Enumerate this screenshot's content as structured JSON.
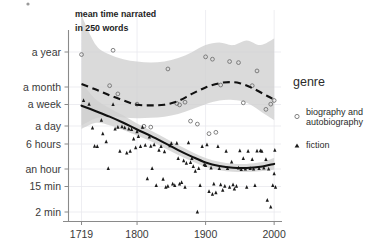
{
  "chart_data": {
    "type": "scatter",
    "title": "",
    "annotation": [
      "mean time narrated",
      "in 250 words"
    ],
    "xlabel": "",
    "ylabel": "",
    "xlim": [
      1700,
      2010
    ],
    "x_ticks": [
      1719,
      1800,
      1900,
      2000
    ],
    "x_tick_labels": [
      "1719",
      "1800",
      "1900",
      "2000"
    ],
    "y_tick_labels": [
      "a year",
      "a month",
      "a week",
      "a day",
      "6 hours",
      "an hour",
      "15 min",
      "2 min"
    ],
    "y_tick_values_minutes": [
      525600,
      43200,
      10080,
      1440,
      360,
      60,
      15,
      2
    ],
    "y_scale": "log",
    "grid": "vertical-faint",
    "legend": {
      "title": "genre",
      "position": "right",
      "entries": [
        {
          "label": "biography and autobiography",
          "marker": "open-circle",
          "color": "#6d6d6d"
        },
        {
          "label": "fiction",
          "marker": "filled-triangle",
          "color": "#1a1a1a"
        }
      ]
    },
    "series": [
      {
        "name": "biography and autobiography",
        "marker": "open-circle",
        "trend_style": "dashed",
        "trend_points": [
          [
            1719,
            43200
          ],
          [
            1740,
            28000
          ],
          [
            1760,
            18000
          ],
          [
            1780,
            12000
          ],
          [
            1800,
            8600
          ],
          [
            1820,
            8200
          ],
          [
            1840,
            8600
          ],
          [
            1860,
            11500
          ],
          [
            1880,
            20000
          ],
          [
            1900,
            33000
          ],
          [
            1920,
            46000
          ],
          [
            1935,
            50000
          ],
          [
            1950,
            46000
          ],
          [
            1970,
            30000
          ],
          [
            1990,
            17000
          ],
          [
            2000,
            13000
          ]
        ],
        "band_upper": [
          [
            1719,
            9000000
          ],
          [
            1740,
            900000
          ],
          [
            1760,
            430000
          ],
          [
            1780,
            300000
          ],
          [
            1800,
            250000
          ],
          [
            1820,
            230000
          ],
          [
            1840,
            250000
          ],
          [
            1860,
            330000
          ],
          [
            1880,
            520000
          ],
          [
            1900,
            900000
          ],
          [
            1920,
            1100000
          ],
          [
            1940,
            900000
          ],
          [
            1960,
            1300000
          ],
          [
            1980,
            900000
          ],
          [
            2000,
            1500000
          ]
        ],
        "band_lower": [
          [
            1719,
            1700
          ],
          [
            1740,
            3000
          ],
          [
            1760,
            3400
          ],
          [
            1780,
            3200
          ],
          [
            1800,
            3000
          ],
          [
            1820,
            3100
          ],
          [
            1840,
            3400
          ],
          [
            1860,
            4200
          ],
          [
            1880,
            6000
          ],
          [
            1900,
            9000
          ],
          [
            1920,
            12000
          ],
          [
            1940,
            12500
          ],
          [
            1960,
            10000
          ],
          [
            1980,
            5200
          ],
          [
            2000,
            2600
          ]
        ],
        "points": [
          [
            1719,
            430000
          ],
          [
            1765,
            600000
          ],
          [
            1760,
            38000
          ],
          [
            1772,
            20000
          ],
          [
            1800,
            9000
          ],
          [
            1810,
            1600
          ],
          [
            1820,
            1500
          ],
          [
            1845,
            140000
          ],
          [
            1858,
            9500
          ],
          [
            1862,
            8500
          ],
          [
            1870,
            10500
          ],
          [
            1878,
            2400
          ],
          [
            1888,
            1900
          ],
          [
            1900,
            360000
          ],
          [
            1905,
            900
          ],
          [
            1910,
            300000
          ],
          [
            1915,
            1000
          ],
          [
            1922,
            40000
          ],
          [
            1935,
            250000
          ],
          [
            1948,
            230000
          ],
          [
            1955,
            10000
          ],
          [
            1968,
            38000
          ],
          [
            1975,
            120000
          ],
          [
            1988,
            6000
          ],
          [
            1995,
            9000
          ],
          [
            2000,
            12000
          ]
        ]
      },
      {
        "name": "fiction",
        "marker": "filled-triangle",
        "trend_style": "solid",
        "trend_points": [
          [
            1719,
            8000
          ],
          [
            1740,
            5200
          ],
          [
            1760,
            3400
          ],
          [
            1780,
            2100
          ],
          [
            1800,
            1250
          ],
          [
            1820,
            760
          ],
          [
            1840,
            440
          ],
          [
            1860,
            250
          ],
          [
            1880,
            150
          ],
          [
            1900,
            95
          ],
          [
            1920,
            72
          ],
          [
            1940,
            63
          ],
          [
            1960,
            62
          ],
          [
            1980,
            68
          ],
          [
            2000,
            85
          ]
        ],
        "band_upper": [
          [
            1719,
            48000
          ],
          [
            1740,
            13000
          ],
          [
            1760,
            6600
          ],
          [
            1780,
            3700
          ],
          [
            1800,
            2000
          ],
          [
            1820,
            1150
          ],
          [
            1840,
            660
          ],
          [
            1860,
            370
          ],
          [
            1880,
            215
          ],
          [
            1900,
            135
          ],
          [
            1920,
            100
          ],
          [
            1940,
            86
          ],
          [
            1960,
            85
          ],
          [
            1980,
            96
          ],
          [
            2000,
            135
          ]
        ],
        "band_lower": [
          [
            1719,
            1300
          ],
          [
            1740,
            2100
          ],
          [
            1760,
            1750
          ],
          [
            1780,
            1200
          ],
          [
            1800,
            780
          ],
          [
            1820,
            500
          ],
          [
            1840,
            295
          ],
          [
            1860,
            170
          ],
          [
            1880,
            105
          ],
          [
            1900,
            67
          ],
          [
            1920,
            52
          ],
          [
            1940,
            46
          ],
          [
            1960,
            45
          ],
          [
            1980,
            48
          ],
          [
            2000,
            54
          ]
        ],
        "points": [
          [
            1722,
            12000
          ],
          [
            1730,
            9000
          ],
          [
            1735,
            1400
          ],
          [
            1738,
            340
          ],
          [
            1742,
            330
          ],
          [
            1748,
            2600
          ],
          [
            1750,
            900
          ],
          [
            1755,
            480
          ],
          [
            1758,
            60
          ],
          [
            1765,
            8800
          ],
          [
            1768,
            1300
          ],
          [
            1772,
            1500
          ],
          [
            1775,
            230
          ],
          [
            1778,
            1550
          ],
          [
            1782,
            1450
          ],
          [
            1785,
            200
          ],
          [
            1788,
            1300
          ],
          [
            1790,
            230
          ],
          [
            1792,
            1250
          ],
          [
            1795,
            600
          ],
          [
            1798,
            300
          ],
          [
            1800,
            1050
          ],
          [
            1802,
            720
          ],
          [
            1805,
            330
          ],
          [
            1808,
            1500
          ],
          [
            1812,
            370
          ],
          [
            1815,
            27
          ],
          [
            1818,
            700
          ],
          [
            1820,
            340
          ],
          [
            1822,
            60
          ],
          [
            1825,
            380
          ],
          [
            1828,
            16
          ],
          [
            1832,
            250
          ],
          [
            1835,
            330
          ],
          [
            1838,
            26
          ],
          [
            1840,
            220
          ],
          [
            1842,
            14
          ],
          [
            1845,
            15
          ],
          [
            1848,
            350
          ],
          [
            1850,
            420
          ],
          [
            1852,
            18
          ],
          [
            1855,
            16
          ],
          [
            1858,
            430
          ],
          [
            1860,
            130
          ],
          [
            1862,
            18
          ],
          [
            1865,
            20
          ],
          [
            1868,
            110
          ],
          [
            1870,
            14
          ],
          [
            1872,
            90
          ],
          [
            1875,
            450
          ],
          [
            1878,
            95
          ],
          [
            1880,
            130
          ],
          [
            1882,
            70
          ],
          [
            1885,
            48
          ],
          [
            1888,
            2
          ],
          [
            1890,
            60
          ],
          [
            1892,
            16
          ],
          [
            1895,
            330
          ],
          [
            1898,
            80
          ],
          [
            1900,
            75
          ],
          [
            1902,
            380
          ],
          [
            1905,
            10
          ],
          [
            1908,
            62
          ],
          [
            1910,
            8
          ],
          [
            1912,
            18
          ],
          [
            1915,
            9
          ],
          [
            1918,
            330
          ],
          [
            1920,
            60
          ],
          [
            1922,
            17
          ],
          [
            1925,
            11
          ],
          [
            1928,
            15
          ],
          [
            1930,
            230
          ],
          [
            1932,
            60
          ],
          [
            1935,
            14
          ],
          [
            1938,
            100
          ],
          [
            1940,
            17
          ],
          [
            1942,
            12
          ],
          [
            1945,
            15
          ],
          [
            1948,
            62
          ],
          [
            1950,
            240
          ],
          [
            1952,
            55
          ],
          [
            1955,
            130
          ],
          [
            1958,
            57
          ],
          [
            1960,
            14
          ],
          [
            1962,
            230
          ],
          [
            1965,
            60
          ],
          [
            1968,
            120
          ],
          [
            1970,
            58
          ],
          [
            1972,
            16
          ],
          [
            1975,
            235
          ],
          [
            1978,
            60
          ],
          [
            1980,
            240
          ],
          [
            1982,
            230
          ],
          [
            1985,
            62
          ],
          [
            1988,
            120
          ],
          [
            1990,
            5
          ],
          [
            1992,
            58
          ],
          [
            1995,
            3
          ],
          [
            1998,
            16
          ],
          [
            2000,
            40
          ],
          [
            2001,
            250
          ],
          [
            2002,
            14
          ]
        ]
      }
    ]
  },
  "colors": {
    "band": "#cfcfcf",
    "line": "#111111",
    "bio_marker": "#6d6d6d",
    "fiction_marker": "#1a1a1a",
    "axis": "#8a8a8a",
    "grid": "#e9e9ee",
    "text": "#2b2b2b",
    "background": "#ffffff"
  }
}
